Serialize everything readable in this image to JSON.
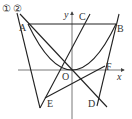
{
  "figure": {
    "type": "coordinate-geometry",
    "axes": {
      "x_label": "x",
      "y_label": "y",
      "origin_label": "O"
    },
    "curve_labels": [
      "①",
      "②"
    ],
    "points": [
      {
        "name": "A",
        "px": [
          28,
          24
        ]
      },
      {
        "name": "B",
        "px": [
          116,
          24
        ]
      },
      {
        "name": "C",
        "px": [
          88,
          16
        ]
      },
      {
        "name": "D",
        "px": [
          99,
          99
        ]
      },
      {
        "name": "E",
        "px": [
          45,
          98
        ]
      },
      {
        "name": "F",
        "px": [
          104,
          66
        ]
      },
      {
        "name": "O",
        "px": [
          72,
          70
        ]
      }
    ],
    "labels": {
      "A": "A",
      "B": "B",
      "C": "C",
      "D": "D",
      "E": "E",
      "F": "F",
      "O": "O",
      "x": "x",
      "y": "y",
      "c1": "①",
      "c2": "②"
    },
    "colors": {
      "line": "#222222",
      "axis": "#555555",
      "background": "#ffffff"
    }
  }
}
